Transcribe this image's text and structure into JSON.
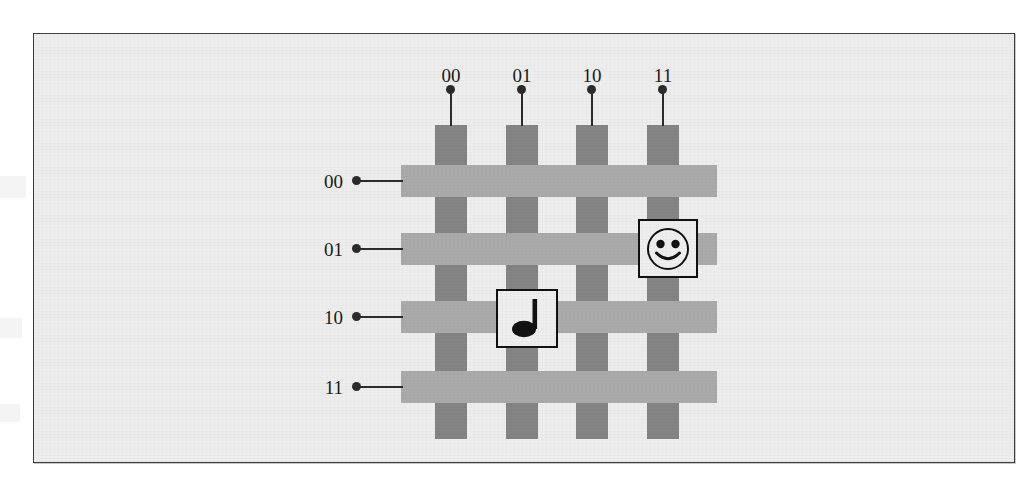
{
  "figure": {
    "kind": "weave-grid-diagram",
    "caption": "",
    "colors": {
      "page_background": "#ffffff",
      "figure_background": "#ededed",
      "frame_border": "#3d3d3d",
      "column_bar": "#848484",
      "row_bar": "#abaaaa",
      "marker": "#2b2b2b",
      "icon_tile_fill": "#eeeeee",
      "icon_tile_border": "#111111",
      "ink": "#1a1a1a"
    }
  },
  "columns": {
    "axis_name": "column-index",
    "labels": [
      "00",
      "01",
      "10",
      "11"
    ],
    "count": 4
  },
  "rows": {
    "axis_name": "row-index",
    "labels": [
      "00",
      "01",
      "10",
      "11"
    ],
    "count": 4
  },
  "icons": [
    {
      "id": "smiley",
      "name": "smiley-face-icon",
      "glyph": "smiley-face",
      "row_label": "01",
      "column_label": "11"
    },
    {
      "id": "note",
      "name": "quarter-note-icon",
      "glyph": "quarter-note",
      "row_label": "10",
      "column_label": "01"
    }
  ],
  "bleed_text": {
    "left_upper": "",
    "left_mid": "",
    "left_lower": ""
  }
}
